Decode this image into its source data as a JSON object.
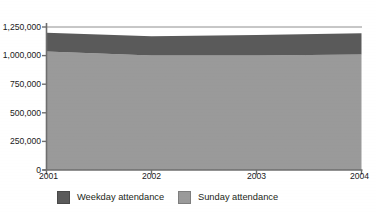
{
  "figure": {
    "clipped_title_fragment": "attendance",
    "background_color": "#ffffff"
  },
  "axes": {
    "y_ticks": [
      "0",
      "250,000",
      "500,000",
      "750,000",
      "1,000,000",
      "1,250,000"
    ],
    "x_ticks": [
      "2001",
      "2002",
      "2003",
      "2004"
    ],
    "axis_color": "#6e6e6e",
    "tick_label_color": "#1a1a1a"
  },
  "legend": {
    "items": [
      {
        "label": "Weekday attendance",
        "color": "#5a5a5a"
      },
      {
        "label": "Sunday attendance",
        "color": "#9a9a9a"
      }
    ]
  },
  "chart_data": {
    "type": "area",
    "stacked": true,
    "title": "",
    "xlabel": "",
    "ylabel": "",
    "x": [
      2001,
      2002,
      2003,
      2004
    ],
    "xlim": [
      2001,
      2004
    ],
    "ylim": [
      0,
      1250000
    ],
    "ytick_values": [
      0,
      250000,
      500000,
      750000,
      1000000,
      1250000
    ],
    "grid": "horizontal-top-only",
    "legend_position": "bottom",
    "series": [
      {
        "name": "Sunday attendance",
        "color": "#9a9a9a",
        "values": [
          1035000,
          1000000,
          1000000,
          1010000
        ]
      },
      {
        "name": "Weekday attendance",
        "color": "#5a5a5a",
        "values": [
          165000,
          170000,
          180000,
          185000
        ]
      }
    ],
    "totals": [
      1200000,
      1170000,
      1180000,
      1195000
    ]
  }
}
